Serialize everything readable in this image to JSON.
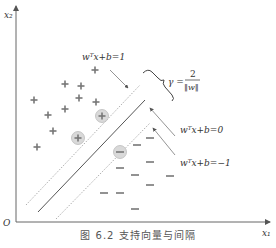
{
  "figure": {
    "caption": "图 6.2  支持向量与间隔",
    "axes": {
      "x_label": "x₁",
      "y_label": "x₂",
      "origin_label": "O"
    },
    "annotations": {
      "upper_margin": "wᵀx+b=1",
      "hyperplane": "wᵀx+b=0",
      "lower_margin": "wᵀx+b=−1",
      "margin_gamma": "γ =",
      "margin_num": "2",
      "margin_den": "‖w‖"
    },
    "colors": {
      "line": "#555555",
      "marker": "#777777",
      "support_vector_fill": "#d9d9d9"
    },
    "positive_points": [
      [
        95,
        70
      ],
      [
        65,
        84
      ],
      [
        81,
        86
      ],
      [
        34,
        100
      ],
      [
        79,
        98
      ],
      [
        96,
        102
      ],
      [
        48,
        115
      ],
      [
        65,
        109
      ],
      [
        53,
        131
      ],
      [
        37,
        147
      ]
    ],
    "positive_support_vectors": [
      [
        102,
        116
      ],
      [
        78,
        138
      ]
    ],
    "negative_points": [
      [
        150,
        138
      ],
      [
        137,
        145
      ],
      [
        150,
        162
      ],
      [
        120,
        168
      ],
      [
        135,
        175
      ],
      [
        170,
        176
      ],
      [
        150,
        185
      ],
      [
        104,
        193
      ],
      [
        120,
        193
      ],
      [
        135,
        209
      ]
    ],
    "negative_support_vectors": [
      [
        120,
        152
      ]
    ]
  }
}
